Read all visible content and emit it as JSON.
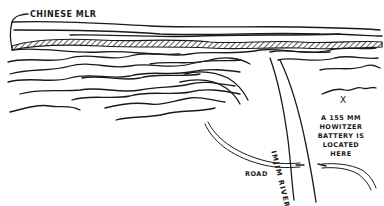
{
  "map": {
    "style": "hand-drawn pen sketch",
    "ink_color": "#1a1a1a",
    "background_color": "#ffffff",
    "labels": {
      "mlr": "CHINESE MLR",
      "river": "IMJIM RIVER",
      "road": "ROAD",
      "battery_marker": "X",
      "battery_text": "A 155 MM HOWITZER BATTERY IS LOCATED HERE"
    },
    "features": [
      {
        "name": "chinese-mlr-ridge",
        "type": "hatched ridge line"
      },
      {
        "name": "imjim-river",
        "type": "river"
      },
      {
        "name": "road",
        "type": "road"
      },
      {
        "name": "bridge",
        "type": "river crossing"
      },
      {
        "name": "howitzer-battery-position",
        "type": "point marker"
      }
    ]
  }
}
